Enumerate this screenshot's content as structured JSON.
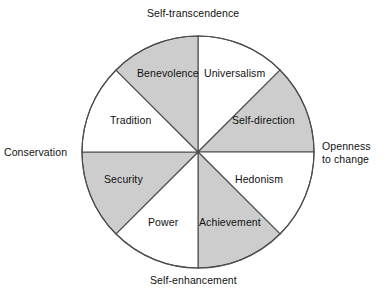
{
  "figure": {
    "type": "circumplex-diagram",
    "title_visible": false,
    "background_color": "#ffffff",
    "shaded_sector_color": "#cdcdcd",
    "unshaded_sector_color": "#ffffff",
    "outline_color": "#4d4d4d"
  },
  "axis_labels": {
    "top": "Self-transcendence",
    "bottom": "Self-enhancement",
    "left": "Conservation",
    "right": "Openness\nto change"
  },
  "sectors": [
    {
      "label": "Universalism",
      "shaded": false,
      "start_deg": 0,
      "end_deg": 45
    },
    {
      "label": "Self-direction",
      "shaded": true,
      "start_deg": 45,
      "end_deg": 90
    },
    {
      "label": "Hedonism",
      "shaded": false,
      "start_deg": 90,
      "end_deg": 135
    },
    {
      "label": "Achievement",
      "shaded": true,
      "start_deg": 135,
      "end_deg": 180
    },
    {
      "label": "Power",
      "shaded": false,
      "start_deg": 180,
      "end_deg": 225
    },
    {
      "label": "Security",
      "shaded": true,
      "start_deg": 225,
      "end_deg": 270
    },
    {
      "label": "Tradition",
      "shaded": false,
      "start_deg": 270,
      "end_deg": 315
    },
    {
      "label": "Benevolence",
      "shaded": true,
      "start_deg": 315,
      "end_deg": 360
    }
  ],
  "geometry": {
    "center_x": 198,
    "center_y": 152,
    "radius": 116,
    "sector_count": 8
  }
}
